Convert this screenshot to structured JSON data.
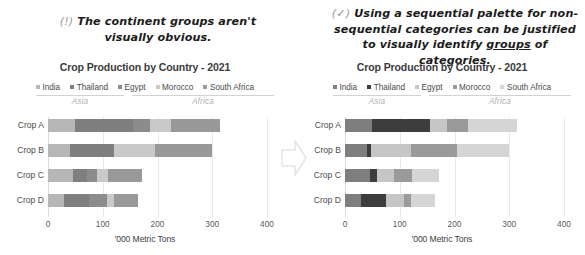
{
  "annotations": {
    "left": {
      "marker": "(!)",
      "text": "The continent groups aren't visually obvious."
    },
    "right": {
      "marker": "(✓)",
      "text_before": "Using a sequential palette for non-sequential categories can be justified to visually identify ",
      "text_underlined": "groups",
      "text_after": " of categories."
    }
  },
  "arrow": {
    "icon": "right-arrow-icon"
  },
  "charts": [
    {
      "id": "left",
      "title": "Crop Production by Country - 2021",
      "legend": [
        {
          "label": "India",
          "color": "#b7b7b7"
        },
        {
          "label": "Thailand",
          "color": "#7f7f7f"
        },
        {
          "label": "Egypt",
          "color": "#8c8c8c"
        },
        {
          "label": "Morocco",
          "color": "#c9c9c9"
        },
        {
          "label": "South Africa",
          "color": "#999999"
        }
      ],
      "groups": [
        {
          "label": "Asia",
          "start": 0,
          "span": 2
        },
        {
          "label": "Africa",
          "start": 2,
          "span": 3
        }
      ],
      "chart_data": {
        "type": "bar",
        "orientation": "horizontal",
        "stacked": true,
        "title": "Crop Production by Country - 2021",
        "xlabel": "'000 Metric Tons",
        "ylabel": "",
        "xlim": [
          0,
          400
        ],
        "xticks": [
          0,
          100,
          200,
          300,
          400
        ],
        "grid": true,
        "legend_position": "top",
        "categories": [
          "Crop A",
          "Crop B",
          "Crop C",
          "Crop D"
        ],
        "series": [
          {
            "name": "India",
            "color": "#b7b7b7",
            "values": [
              50,
              40,
              45,
              30
            ]
          },
          {
            "name": "Thailand",
            "color": "#7f7f7f",
            "values": [
              105,
              80,
              27,
              45
            ]
          },
          {
            "name": "Egypt",
            "color": "#8c8c8c",
            "values": [
              32,
              0,
              18,
              33
            ]
          },
          {
            "name": "Morocco",
            "color": "#c9c9c9",
            "values": [
              38,
              75,
              20,
              12
            ]
          },
          {
            "name": "South Africa",
            "color": "#999999",
            "values": [
              90,
              105,
              62,
              45
            ]
          }
        ],
        "totals": [
          315,
          300,
          172,
          165
        ]
      }
    },
    {
      "id": "right",
      "title": "Crop Production by Country - 2021",
      "legend": [
        {
          "label": "India",
          "color": "#7e7e7e"
        },
        {
          "label": "Thailand",
          "color": "#3d3d3d"
        },
        {
          "label": "Egypt",
          "color": "#c6c6c6"
        },
        {
          "label": "Morocco",
          "color": "#9a9a9a"
        },
        {
          "label": "South Africa",
          "color": "#d5d5d5"
        }
      ],
      "groups": [
        {
          "label": "Asia",
          "start": 0,
          "span": 2
        },
        {
          "label": "Africa",
          "start": 2,
          "span": 3
        }
      ],
      "chart_data": {
        "type": "bar",
        "orientation": "horizontal",
        "stacked": true,
        "title": "Crop Production by Country - 2021",
        "xlabel": "'000 Metric Tons",
        "ylabel": "",
        "xlim": [
          0,
          400
        ],
        "xticks": [
          0,
          100,
          200,
          300,
          400
        ],
        "grid": true,
        "legend_position": "top",
        "categories": [
          "Crop A",
          "Crop B",
          "Crop C",
          "Crop D"
        ],
        "series": [
          {
            "name": "India",
            "color": "#7e7e7e",
            "values": [
              50,
              40,
              45,
              30
            ]
          },
          {
            "name": "Thailand",
            "color": "#3d3d3d",
            "values": [
              105,
              8,
              13,
              45
            ]
          },
          {
            "name": "Egypt",
            "color": "#c6c6c6",
            "values": [
              32,
              72,
              32,
              33
            ]
          },
          {
            "name": "Morocco",
            "color": "#9a9a9a",
            "values": [
              38,
              85,
              32,
              12
            ]
          },
          {
            "name": "South Africa",
            "color": "#d5d5d5",
            "values": [
              90,
              95,
              50,
              45
            ]
          }
        ],
        "totals": [
          315,
          300,
          172,
          165
        ]
      }
    }
  ]
}
